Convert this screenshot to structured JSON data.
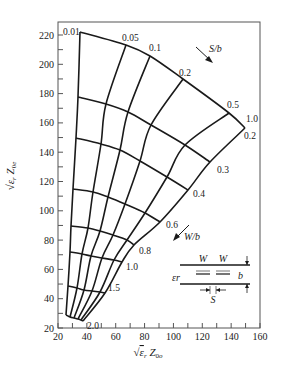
{
  "chart_data": {
    "type": "line",
    "title": "",
    "xlabel": "√εr Z0o",
    "ylabel": "√εr Z0e",
    "xlim": [
      20,
      160
    ],
    "ylim": [
      20,
      229
    ],
    "x_ticks": [
      20,
      40,
      60,
      80,
      100,
      120,
      140,
      160
    ],
    "y_ticks": [
      20,
      40,
      60,
      80,
      100,
      120,
      140,
      160,
      180,
      200,
      220
    ],
    "x_minor_step": 10,
    "y_minor_step": 10,
    "grid": false,
    "family_s_over_b": {
      "label": "S/b",
      "values": [
        0.01,
        0.05,
        0.1,
        0.2,
        0.5,
        1.0
      ],
      "labels": [
        "0.01",
        "0.05",
        "0.1",
        "0.2",
        "0.5",
        "1.0"
      ]
    },
    "family_w_over_b": {
      "label": "W/b",
      "values": [
        0.2,
        0.3,
        0.4,
        0.6,
        0.8,
        1.0,
        1.5,
        2.0
      ],
      "labels": [
        "0.2",
        "0.3",
        "0.4",
        "0.6",
        "0.8",
        "1.0",
        "1.5",
        "2.0"
      ]
    },
    "grid_points_note": "points[i][j] = [Z0o, Z0e] at W/b index i and S/b index j",
    "points": [
      [
        [
          35.2,
          222.0
        ],
        [
          67.1,
          213.1
        ],
        [
          83.7,
          205.6
        ],
        [
          106.6,
          190.0
        ],
        [
          138.5,
          166.7
        ],
        [
          149.6,
          156.5
        ]
      ],
      [
        [
          33.9,
          177.6
        ],
        [
          60.9,
          169.8
        ],
        [
          73.7,
          164.4
        ],
        [
          93.8,
          152.6
        ],
        [
          123.3,
          135.3
        ],
        [
          132.6,
          133.3
        ]
      ],
      [
        [
          32.5,
          149.7
        ],
        [
          56.0,
          143.2
        ],
        [
          67.1,
          138.9
        ],
        [
          84.4,
          131.1
        ],
        [
          109.3,
          118.2
        ],
        [
          117.3,
          114.2
        ]
      ],
      [
        [
          30.8,
          114.8
        ],
        [
          50.5,
          111.4
        ],
        [
          59.5,
          108.3
        ],
        [
          73.7,
          102.3
        ],
        [
          94.5,
          94.6
        ],
        [
          98.3,
          92.4
        ]
      ],
      [
        [
          29.4,
          89.6
        ],
        [
          45.6,
          87.5
        ],
        [
          53.2,
          84.9
        ],
        [
          65.0,
          80.8
        ],
        [
          80.2,
          76.8
        ],
        [
          83.0,
          76.7
        ]
      ],
      [
        [
          28.7,
          71.9
        ],
        [
          42.2,
          70.8
        ],
        [
          48.4,
          69.3
        ],
        [
          57.4,
          67.0
        ],
        [
          69.0,
          64.7
        ],
        [
          73.7,
          65.0
        ]
      ],
      [
        [
          27.3,
          43.9
        ],
        [
          36.7,
          43.5
        ],
        [
          40.8,
          43.2
        ],
        [
          46.7,
          42.7
        ],
        [
          55.0,
          41.9
        ],
        [
          56.3,
          50.7
        ]
      ],
      [
        [
          26.0,
          42.0
        ],
        [
          29.4,
          40.8
        ],
        [
          31.5,
          40.5
        ],
        [
          34.3,
          40.1
        ],
        [
          37.0,
          39.4
        ],
        [
          36.7,
          39.4
        ]
      ]
    ],
    "annotations": [
      {
        "text": "S/b",
        "arrow": "down-right",
        "x": 116,
        "y": 210
      },
      {
        "text": "W/b",
        "arrow": "down-left",
        "x": 128,
        "y": 76
      }
    ],
    "inset": {
      "labels": {
        "w1": "W",
        "w2": "W",
        "b": "b",
        "er": "εr",
        "s": "S"
      }
    }
  }
}
